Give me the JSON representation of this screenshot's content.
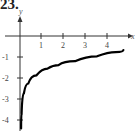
{
  "problem_number": "23.",
  "chart_data": {
    "type": "line",
    "title": "",
    "xlabel": "x",
    "ylabel": "y",
    "xlim": [
      -0.9,
      5.0
    ],
    "ylim": [
      -4.5,
      1.1
    ],
    "xticks": [
      "1",
      "2",
      "3",
      "4"
    ],
    "yticks": [
      "-1",
      "-2",
      "-3",
      "-4"
    ],
    "grid": false,
    "series": [
      {
        "name": "curve",
        "x": [
          0.05,
          0.1,
          0.25,
          0.5,
          1,
          1.5,
          2,
          3,
          4,
          4.7
        ],
        "y": [
          -4.4,
          -3.0,
          -2.45,
          -2.07,
          -1.67,
          -1.44,
          -1.33,
          -1.07,
          -0.86,
          -0.67
        ]
      }
    ]
  }
}
